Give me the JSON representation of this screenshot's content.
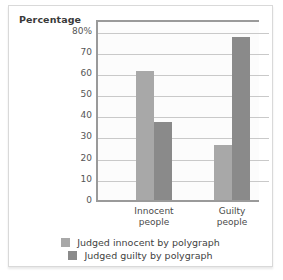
{
  "chart_data": {
    "type": "bar",
    "title": "",
    "ylabel": "Percentage",
    "xlabel": "",
    "categories": [
      "Innocent people",
      "Guilty people"
    ],
    "category_lines": [
      [
        "Innocent",
        "people"
      ],
      [
        "Guilty",
        "people"
      ]
    ],
    "series": [
      {
        "name": "Judged innocent by polygraph",
        "color": "#a8a8a8",
        "values": [
          61,
          26
        ]
      },
      {
        "name": "Judged guilty by polygraph",
        "color": "#8a8a8a",
        "values": [
          37,
          77
        ]
      }
    ],
    "ylim": [
      0,
      85
    ],
    "yticks": [
      0,
      10,
      20,
      30,
      40,
      50,
      60,
      70,
      80
    ],
    "ytick_labels": [
      "0",
      "10",
      "20",
      "30",
      "40",
      "50",
      "60",
      "70",
      "80%"
    ],
    "grid": true,
    "legend_position": "bottom",
    "units": "percent"
  },
  "legend": {
    "items": [
      {
        "label": "Judged innocent by polygraph",
        "color": "#a8a8a8"
      },
      {
        "label": "Judged guilty by polygraph",
        "color": "#8a8a8a"
      }
    ]
  },
  "colors": {
    "series_light": "#a8a8a8",
    "series_dark": "#8a8a8a",
    "axis": "#9a9a9a",
    "grid": "#c9c9c9",
    "text": "#3a3a3a",
    "frame": "#d9d9d9",
    "plot_background": "#fcfcfc"
  }
}
